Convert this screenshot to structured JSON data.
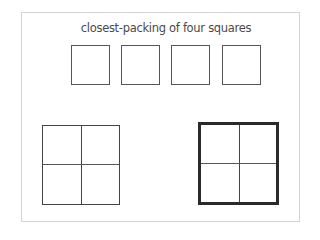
{
  "diagram": {
    "title": "closest-packing of four squares",
    "row_squares": [
      {
        "id": 1,
        "left": 71
      },
      {
        "id": 2,
        "left": 121
      },
      {
        "id": 3,
        "left": 171
      },
      {
        "id": 4,
        "left": 222
      }
    ],
    "packed_grids": [
      {
        "id": "thin-outline",
        "border": "thin",
        "color": "#444444"
      },
      {
        "id": "thick-outline",
        "border": "thick",
        "color": "#2a2a2a"
      }
    ]
  }
}
